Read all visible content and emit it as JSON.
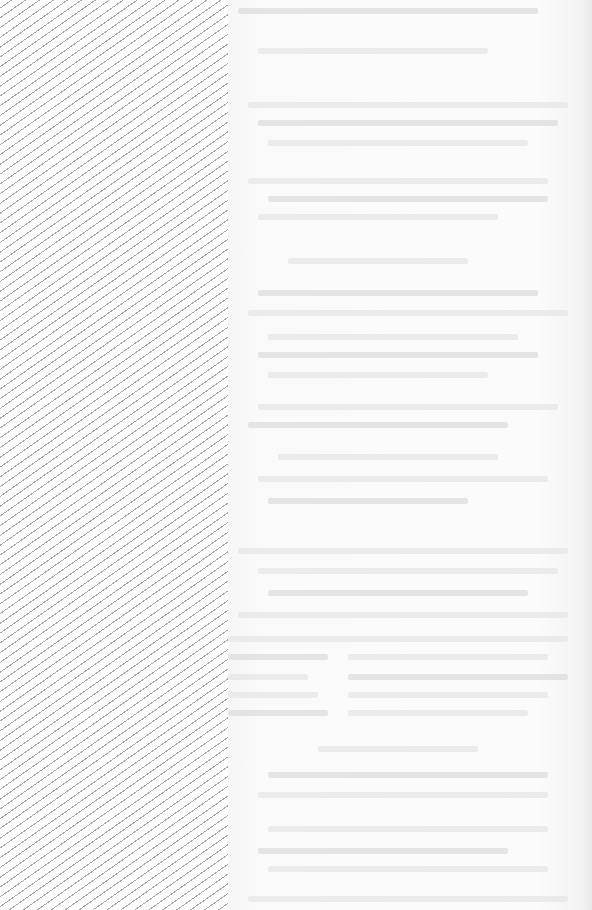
{
  "document": {
    "type": "scanned-page",
    "left_panel": {
      "pattern": "diagonal-hatch",
      "color": "#a9a9a9"
    },
    "body_text": "",
    "note_legibility": "bleed-through text from reverse side; not legible"
  },
  "ghost_lines": [
    {
      "x": 10,
      "y": 8,
      "w": 300
    },
    {
      "x": 30,
      "y": 48,
      "w": 230
    },
    {
      "x": 20,
      "y": 102,
      "w": 320
    },
    {
      "x": 30,
      "y": 120,
      "w": 300
    },
    {
      "x": 40,
      "y": 140,
      "w": 260
    },
    {
      "x": 20,
      "y": 178,
      "w": 300
    },
    {
      "x": 40,
      "y": 196,
      "w": 280
    },
    {
      "x": 30,
      "y": 214,
      "w": 240
    },
    {
      "x": 60,
      "y": 258,
      "w": 180
    },
    {
      "x": 30,
      "y": 290,
      "w": 280
    },
    {
      "x": 20,
      "y": 310,
      "w": 320
    },
    {
      "x": 40,
      "y": 334,
      "w": 250
    },
    {
      "x": 30,
      "y": 352,
      "w": 280
    },
    {
      "x": 40,
      "y": 372,
      "w": 220
    },
    {
      "x": 30,
      "y": 404,
      "w": 300
    },
    {
      "x": 20,
      "y": 422,
      "w": 260
    },
    {
      "x": 50,
      "y": 454,
      "w": 220
    },
    {
      "x": 30,
      "y": 476,
      "w": 290
    },
    {
      "x": 40,
      "y": 498,
      "w": 200
    },
    {
      "x": 10,
      "y": 548,
      "w": 330
    },
    {
      "x": 30,
      "y": 568,
      "w": 300
    },
    {
      "x": 40,
      "y": 590,
      "w": 260
    },
    {
      "x": 10,
      "y": 612,
      "w": 330
    },
    {
      "x": 0,
      "y": 636,
      "w": 340
    },
    {
      "x": 0,
      "y": 654,
      "w": 100
    },
    {
      "x": 120,
      "y": 654,
      "w": 200
    },
    {
      "x": 0,
      "y": 674,
      "w": 80
    },
    {
      "x": 120,
      "y": 674,
      "w": 220
    },
    {
      "x": 0,
      "y": 692,
      "w": 90
    },
    {
      "x": 120,
      "y": 692,
      "w": 200
    },
    {
      "x": 0,
      "y": 710,
      "w": 100
    },
    {
      "x": 120,
      "y": 710,
      "w": 180
    },
    {
      "x": 90,
      "y": 746,
      "w": 160
    },
    {
      "x": 40,
      "y": 772,
      "w": 280
    },
    {
      "x": 30,
      "y": 792,
      "w": 290
    },
    {
      "x": 40,
      "y": 826,
      "w": 280
    },
    {
      "x": 30,
      "y": 848,
      "w": 250
    },
    {
      "x": 40,
      "y": 866,
      "w": 280
    },
    {
      "x": 20,
      "y": 896,
      "w": 320
    }
  ]
}
